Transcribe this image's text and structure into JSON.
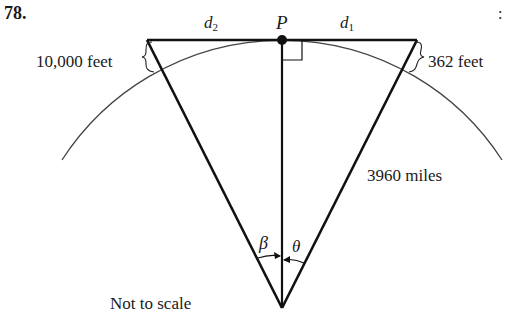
{
  "problem": {
    "number": "78.",
    "caption": "Not to scale",
    "stray_mark": ":"
  },
  "labels": {
    "point": "P",
    "d2_var": "d",
    "d2_sub": "2",
    "d1_var": "d",
    "d1_sub": "1",
    "left_height": "10,000 feet",
    "right_height": "362 feet",
    "radius": "3960 miles",
    "angle_left": "β",
    "angle_right": "θ"
  },
  "colors": {
    "line": "#111111",
    "arc": "#444444",
    "text": "#1a1a1a"
  }
}
